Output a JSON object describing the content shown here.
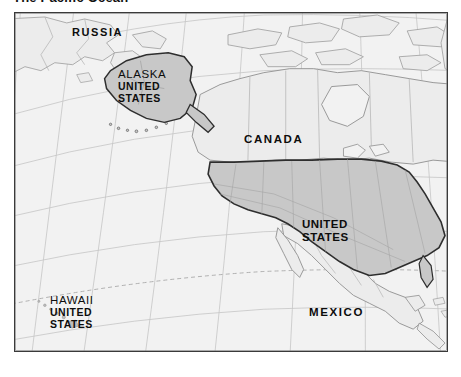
{
  "page": {
    "title": "The Pacific Ocean"
  },
  "map": {
    "name": "north-america-pacific-reference-map",
    "colors": {
      "ocean": "#f2f2f2",
      "land": "#ececec",
      "highlight_land": "#c8c8c8",
      "graticule": "#bdbdbd",
      "coastline": "#8c8c8c",
      "border": "#9a9a9a",
      "highlight_outline": "#2e2e2e",
      "frame": "#3a3a3a",
      "label": "#0d0d0d"
    },
    "labels": {
      "russia": "RUSSIA",
      "canada": "CANADA",
      "mexico": "MEXICO",
      "alaska": {
        "line1": "ALASKA",
        "line2": "UNITED",
        "line3": "STATES"
      },
      "hawaii": {
        "line1": "HAWAII",
        "line2": "UNITED",
        "line3": "STATES"
      },
      "united_states": {
        "line1": "UNITED",
        "line2": "STATES"
      }
    },
    "features": {
      "tropic_of_cancer": "dashed latitude line",
      "graticule": "curved meridians and parallels",
      "highlighted_country": "United States"
    }
  }
}
